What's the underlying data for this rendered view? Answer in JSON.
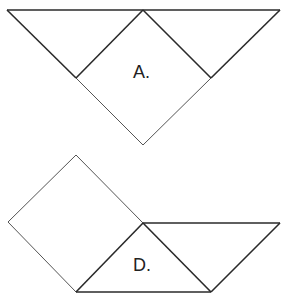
{
  "figures": [
    {
      "id": "A",
      "label": "A.",
      "description": "Large downward triangle split into two corner triangles and a center square rotated 45 degrees that extends below",
      "label_pos": {
        "x": 133,
        "y": 63
      },
      "shapes": {
        "outer_top_edge": [
          [
            7,
            10
          ],
          [
            280,
            10
          ]
        ],
        "left_triangle": [
          [
            7,
            10
          ],
          [
            143,
            10
          ],
          [
            76,
            78
          ]
        ],
        "right_triangle": [
          [
            143,
            10
          ],
          [
            280,
            10
          ],
          [
            211,
            78
          ]
        ],
        "square": [
          [
            143,
            10
          ],
          [
            211,
            78
          ],
          [
            143,
            145
          ],
          [
            76,
            78
          ]
        ]
      }
    },
    {
      "id": "D",
      "label": "D.",
      "description": "Rotated square on the left attached to a triangle and parallelogram on the right",
      "label_pos": {
        "x": 133,
        "y": 256
      },
      "shapes": {
        "square": [
          [
            76,
            155
          ],
          [
            143,
            223
          ],
          [
            76,
            292
          ],
          [
            8,
            222
          ]
        ],
        "center_triangle": [
          [
            143,
            223
          ],
          [
            211,
            292
          ],
          [
            76,
            292
          ]
        ],
        "right_triangle": [
          [
            143,
            223
          ],
          [
            280,
            223
          ],
          [
            211,
            292
          ]
        ]
      }
    }
  ],
  "colors": {
    "background": "#ffffff",
    "stroke_dark": "#2a2a2a",
    "stroke_light": "#555555",
    "text": "#222222"
  }
}
